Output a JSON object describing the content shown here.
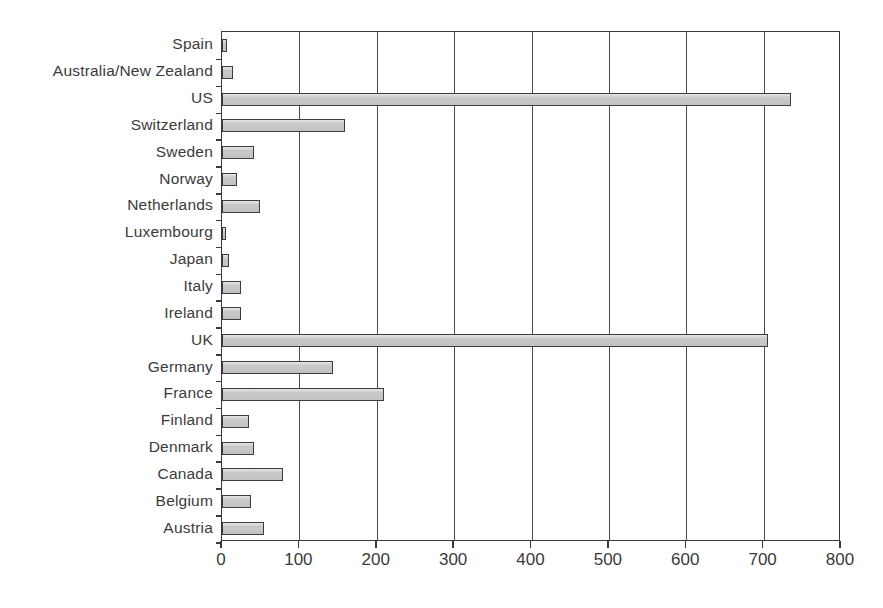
{
  "chart_data": {
    "type": "bar",
    "orientation": "horizontal",
    "title": "",
    "subtitle": "",
    "xlabel": "",
    "ylabel": "",
    "xlim": [
      0,
      800
    ],
    "ylim": null,
    "grid": true,
    "legend": null,
    "legend_position": "none",
    "xticks": [
      "0",
      "100",
      "200",
      "300",
      "400",
      "500",
      "600",
      "700",
      "800"
    ],
    "xtick_values": [
      0,
      100,
      200,
      300,
      400,
      500,
      600,
      700,
      800
    ],
    "categories": [
      "Spain",
      "Australia/New Zealand",
      "US",
      "Switzerland",
      "Sweden",
      "Norway",
      "Netherlands",
      "Luxembourg",
      "Japan",
      "Italy",
      "Ireland",
      "UK",
      "Germany",
      "France",
      "Finland",
      "Denmark",
      "Canada",
      "Belgium",
      "Austria"
    ],
    "values": [
      6,
      14,
      735,
      159,
      41,
      20,
      49,
      5,
      9,
      24,
      24,
      706,
      143,
      209,
      35,
      41,
      79,
      37,
      54
    ],
    "annotations": []
  },
  "style": {
    "bar_fill": "#c9c9c9",
    "bar_stroke": "#3c3c3c",
    "axis_color": "#3a3a3a",
    "grid_color": "#4a4a4a",
    "text_color": "#3b3b3b",
    "background": "#ffffff"
  }
}
